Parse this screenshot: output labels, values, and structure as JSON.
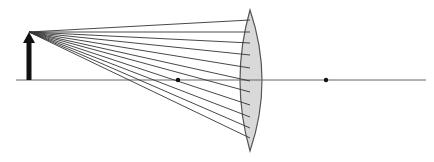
{
  "diagram": {
    "colors": {
      "background": "#ffffff",
      "axis": "#666666",
      "ray": "#333333",
      "lens_fill": "#d9d9d9",
      "lens_stroke": "#555555",
      "object": "#111111",
      "focal_point": "#111111"
    },
    "optical_axis": {
      "x1": 16,
      "x2": 426,
      "y": 80
    },
    "object_arrow": {
      "x": 29,
      "base_y": 80,
      "tip_y": 32,
      "shaft_width": 5,
      "head_half_width": 6,
      "head_height": 11
    },
    "lens": {
      "x": 250,
      "top_y": 10,
      "bottom_y": 151,
      "left_bulge_x": 240,
      "right_bulge_x": 262
    },
    "focal_points": [
      {
        "label": "F-left",
        "x": 178,
        "y": 80
      },
      {
        "label": "F-right",
        "x": 326,
        "y": 80
      }
    ],
    "ray_source": {
      "x": 29,
      "y": 32
    },
    "ray_endpoints_y": [
      20,
      32,
      43,
      55,
      68,
      81,
      92,
      105,
      117,
      128,
      138
    ],
    "ray_end_x": 250
  }
}
